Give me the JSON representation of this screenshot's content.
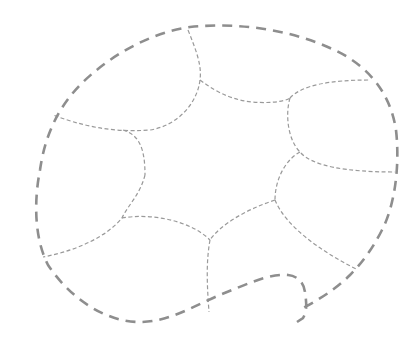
{
  "diagram": {
    "type": "dashed-outline-shape",
    "colors": {
      "background": "#ffffff",
      "outer_stroke": "#8e8e8e",
      "inner_stroke": "#9a9a9a"
    },
    "outer_path": "M 297 322 L 303 318 C 308 310 306 300 305 292 C 304 283 298 276 288 275 C 270 273 245 285 222 294 C 195 305 170 322 140 322 C 105 322 70 298 48 265 C 34 238 34 200 40 170 C 45 135 58 108 80 85 C 110 55 150 33 190 27 C 240 22 290 30 330 48 C 365 63 390 90 396 130 C 400 165 395 205 382 230 C 372 250 360 265 350 275 C 335 290 318 300 303 308",
    "inner_paths": [
      "M 188 30 C 196 50 202 65 200 80 C 197 105 176 126 150 130 C 110 133 80 125 53 115",
      "M 123 130 C 140 135 145 150 145 175",
      "M 200 80 C 220 95 235 100 252 102 C 275 104 288 100 290 98",
      "M 290 98 C 302 85 330 80 370 80",
      "M 290 98 C 285 115 288 140 300 152 C 312 166 345 172 395 172",
      "M 300 152 C 285 160 275 180 275 200",
      "M 275 200 C 285 225 318 250 358 270",
      "M 145 175 C 140 195 128 205 122 218 C 108 235 80 250 43 257",
      "M 122 218 C 150 213 190 220 210 240",
      "M 275 200 C 245 210 220 225 210 240",
      "M 210 240 C 206 262 207 285 209 312"
    ]
  }
}
